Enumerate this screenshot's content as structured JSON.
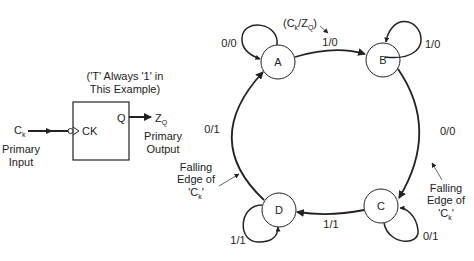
{
  "flipflop": {
    "note_line1": "('T' Always '1' in",
    "note_line2": "This Example)",
    "input_signal": "C",
    "input_sub": "k",
    "input_label_line1": "Primary",
    "input_label_line2": "Input",
    "clock_pin": "CK",
    "output_pin": "Q",
    "output_signal": "Z",
    "output_sub": "Q",
    "output_label_line1": "Primary",
    "output_label_line2": "Output"
  },
  "state_diagram": {
    "legend_open": "(C",
    "legend_sub1": "k",
    "legend_mid": "/Z",
    "legend_sub2": "Q",
    "legend_close": ")",
    "states": [
      {
        "name": "A"
      },
      {
        "name": "B"
      },
      {
        "name": "C"
      },
      {
        "name": "D"
      }
    ],
    "transitions": {
      "A_self": "0/0",
      "A_to_B": "1/0",
      "B_self": "1/0",
      "B_to_C": "0/0",
      "C_self": "0/1",
      "C_to_D": "1/1",
      "D_self": "1/1",
      "D_to_A": "0/1"
    },
    "falling_edge_left": {
      "line1": "Falling",
      "line2": "Edge of",
      "line3a": "'C",
      "line3sub": "k",
      "line3b": "'"
    },
    "falling_edge_right": {
      "line1": "Falling",
      "line2": "Edge of",
      "line3a": "'C",
      "line3sub": "k",
      "line3b": "'"
    }
  }
}
